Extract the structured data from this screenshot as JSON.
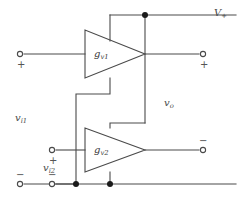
{
  "figure": {
    "kind": "circuit-schematic",
    "line_color": "#4a4a4a",
    "node_color": "#1a1a1a",
    "background": "#ffffff"
  },
  "amplifiers": [
    {
      "id": "amp1",
      "label_main": "g",
      "label_sub": "v1"
    },
    {
      "id": "amp2",
      "label_main": "g",
      "label_sub": "v2"
    }
  ],
  "labels": {
    "supply_positive": {
      "main": "V",
      "sub": "+"
    },
    "output_voltage": {
      "main": "v",
      "sub": "o"
    },
    "input_voltage_1": {
      "main": "v",
      "sub": "i1"
    },
    "input_voltage_2": {
      "main": "v",
      "sub": "i2"
    }
  },
  "polarity_marks": {
    "input1_plus": "+",
    "input1_minus": "−",
    "input2_plus": "+",
    "input2_minus": "−",
    "output_plus": "+",
    "output_minus": "−"
  },
  "terminals": [
    {
      "name": "input-1-positive",
      "x": 20,
      "y": 54,
      "sign": "+"
    },
    {
      "name": "input-1-negative",
      "x": 20,
      "y": 184,
      "sign": "−"
    },
    {
      "name": "input-2-positive",
      "x": 52,
      "y": 150,
      "sign": "+"
    },
    {
      "name": "input-2-negative",
      "x": 52,
      "y": 184,
      "sign": "−"
    },
    {
      "name": "output-positive",
      "x": 203,
      "y": 54,
      "sign": "+"
    },
    {
      "name": "output-negative",
      "x": 203,
      "y": 150,
      "sign": "−"
    }
  ],
  "junctions": [
    {
      "name": "supply-node",
      "x": 145,
      "y": 15
    },
    {
      "name": "ground-node-left",
      "x": 76,
      "y": 184
    },
    {
      "name": "ground-node-right",
      "x": 110,
      "y": 184
    }
  ]
}
